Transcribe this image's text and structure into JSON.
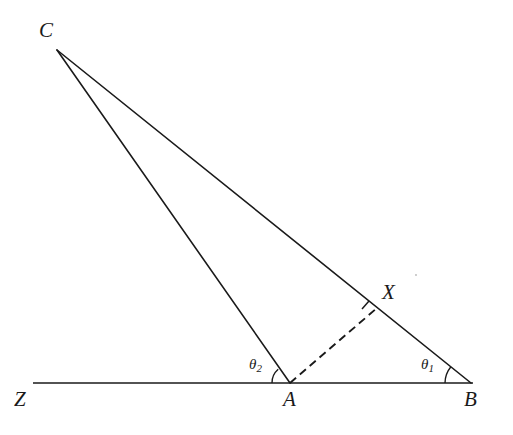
{
  "figure": {
    "type": "geometry-diagram",
    "background_color": "#ffffff",
    "stroke_color": "#1a1a1a",
    "width": 513,
    "height": 435
  },
  "points": {
    "C": {
      "label": "C",
      "x": 57,
      "y": 50,
      "label_x": 39,
      "label_y": 20
    },
    "A": {
      "label": "A",
      "x": 290,
      "y": 383,
      "label_x": 283,
      "label_y": 389
    },
    "B": {
      "label": "B",
      "x": 471,
      "y": 383,
      "label_x": 464,
      "label_y": 389
    },
    "X": {
      "label": "X",
      "x": 377,
      "y": 308,
      "label_x": 382,
      "label_y": 282
    },
    "Z": {
      "label": "Z",
      "x": 33,
      "y": 383,
      "label_x": 14,
      "label_y": 389
    }
  },
  "angles": {
    "theta1": {
      "label": "θ",
      "subscript": "1",
      "label_x": 421,
      "label_y": 357,
      "at_point": "B",
      "arc_radius": 26
    },
    "theta2": {
      "label": "θ",
      "subscript": "2",
      "label_x": 249,
      "label_y": 357,
      "at_point": "A",
      "arc_radius": 18
    }
  },
  "segments": [
    {
      "name": "segment-ZB",
      "from": "Z",
      "to": "B",
      "style": "solid"
    },
    {
      "name": "segment-CA",
      "from": "C",
      "to": "A",
      "style": "solid"
    },
    {
      "name": "segment-CB",
      "from": "C",
      "to": "B",
      "style": "solid"
    },
    {
      "name": "segment-AX",
      "from": "A",
      "to": "X",
      "style": "dashed"
    }
  ],
  "tick_marks": [
    {
      "name": "tick-at-X",
      "on_segment": "segment-CB",
      "at_point": "X"
    }
  ]
}
